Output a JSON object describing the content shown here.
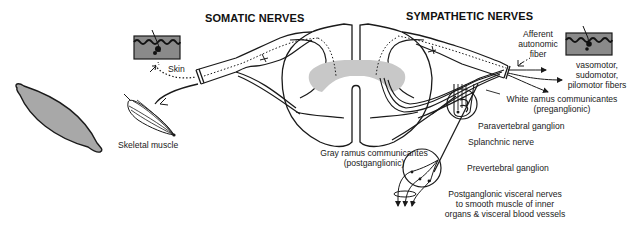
{
  "diagram": {
    "type": "anatomical-schematic"
  },
  "titles": {
    "somatic": "SOMATIC NERVES",
    "sympathetic": "SYMPATHETIC NERVES"
  },
  "labels": {
    "skin": "Skin",
    "skeletal_muscle": "Skeletal muscle",
    "afferent": [
      "Afferent",
      "autonomic",
      "fiber"
    ],
    "effector_fibers": [
      "vasomotor,",
      "sudomotor,",
      "pilomotor fibers"
    ],
    "white_ramus": [
      "White ramus communicantes",
      "(preganglionic)"
    ],
    "paravertebral": "Paravertebral ganglion",
    "splanchnic": "Splanchnic nerve",
    "gray_ramus": [
      "Gray ramus communicantes",
      "(postganglionic)"
    ],
    "prevertebral": "Prevertebral ganglion",
    "postganglionic_visceral": [
      "Postganglonic visceral nerves",
      "to smooth muscle of inner",
      "organs & visceral blood vessels"
    ]
  },
  "structures": [
    {
      "id": "smooth-muscle-cell",
      "desc": "Isolated spindle-shaped muscle cell (gray fill)"
    },
    {
      "id": "skin-left",
      "desc": "Skin patch with sensory ending (somatic side)"
    },
    {
      "id": "skeletal-muscle",
      "desc": "Skeletal muscle fibers with motor ending"
    },
    {
      "id": "spinal-cord",
      "desc": "Spinal cord cross-section with gray matter"
    },
    {
      "id": "skin-right",
      "desc": "Skin patch with autonomic effectors (sympathetic side)"
    },
    {
      "id": "paravertebral-ganglion",
      "desc": "Sympathetic chain ganglion"
    },
    {
      "id": "prevertebral-ganglion",
      "desc": "Collateral ganglion"
    }
  ],
  "colors": {
    "line": "#1a1a1a",
    "gray_matter": "#c8c8c8",
    "skin_fill": "#8a8a8a",
    "muscle_fill": "#a8a8a8",
    "background": "#ffffff"
  }
}
